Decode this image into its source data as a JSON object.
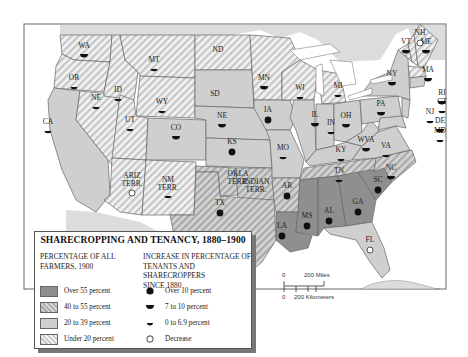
{
  "map": {
    "title": "SHARECROPPING AND TENANCY, 1880–1900",
    "colors": {
      "over55": "#8f8f8f",
      "c40to55_bg": "#d2d2d2",
      "c40to55_stripe": "#a9a9a9",
      "c20to39": "#cfcfcf",
      "under20_bg": "#f2f2f2",
      "under20_stripe": "#c8c8c8",
      "water": "#ffffff",
      "foreign": "#dcdcdc",
      "border": "#666666"
    },
    "states": [
      {
        "abbr": "WA",
        "category": "under20",
        "increase": "7to10"
      },
      {
        "abbr": "OR",
        "category": "under20",
        "increase": "0to6.9"
      },
      {
        "abbr": "CA",
        "category": "20to39",
        "increase": "0to6.9"
      },
      {
        "abbr": "NE",
        "category": "under20",
        "increase": "0to6.9",
        "note": "Nevada (printed NE)"
      },
      {
        "abbr": "ID",
        "category": "under20",
        "increase": "0to6.9"
      },
      {
        "abbr": "MT",
        "category": "under20",
        "increase": "0to6.9"
      },
      {
        "abbr": "WY",
        "category": "under20",
        "increase": "0to6.9"
      },
      {
        "abbr": "UT",
        "category": "under20",
        "increase": "0to6.9"
      },
      {
        "abbr": "CO",
        "category": "20to39",
        "increase": "7to10"
      },
      {
        "abbr": "ARIZ TERR.",
        "category": "under20",
        "increase": "decrease"
      },
      {
        "abbr": "NM TERR.",
        "category": "under20",
        "increase": "0to6.9"
      },
      {
        "abbr": "ND",
        "category": "under20",
        "increase": "none"
      },
      {
        "abbr": "SD",
        "category": "20to39",
        "increase": "none"
      },
      {
        "abbr": "NE",
        "category": "20to39",
        "increase": "7to10",
        "note": "Nebraska"
      },
      {
        "abbr": "KS",
        "category": "20to39",
        "increase": "over10"
      },
      {
        "abbr": "OKLA TERR.",
        "category": "40to55",
        "increase": "none"
      },
      {
        "abbr": "INDIAN TERR.",
        "category": "40to55",
        "increase": "none"
      },
      {
        "abbr": "TX",
        "category": "40to55",
        "increase": "over10"
      },
      {
        "abbr": "MN",
        "category": "under20",
        "increase": "7to10"
      },
      {
        "abbr": "IA",
        "category": "20to39",
        "increase": "over10"
      },
      {
        "abbr": "MO",
        "category": "20to39",
        "increase": "0to6.9"
      },
      {
        "abbr": "AR",
        "category": "40to55",
        "increase": "over10"
      },
      {
        "abbr": "LA",
        "category": "over55",
        "increase": "over10"
      },
      {
        "abbr": "WI",
        "category": "under20",
        "increase": "0to6.9"
      },
      {
        "abbr": "IL",
        "category": "20to39",
        "increase": "7to10"
      },
      {
        "abbr": "MI",
        "category": "under20",
        "increase": "0to6.9"
      },
      {
        "abbr": "IN",
        "category": "20to39",
        "increase": "0to6.9"
      },
      {
        "abbr": "OH",
        "category": "20to39",
        "increase": "7to10"
      },
      {
        "abbr": "KY",
        "category": "20to39",
        "increase": "0to6.9"
      },
      {
        "abbr": "TN",
        "category": "40to55",
        "increase": "0to6.9"
      },
      {
        "abbr": "MS",
        "category": "over55",
        "increase": "over10"
      },
      {
        "abbr": "AL",
        "category": "over55",
        "increase": "over10"
      },
      {
        "abbr": "GA",
        "category": "over55",
        "increase": "over10"
      },
      {
        "abbr": "SC",
        "category": "over55",
        "increase": "over10"
      },
      {
        "abbr": "NC",
        "category": "40to55",
        "increase": "7to10"
      },
      {
        "abbr": "VA",
        "category": "20to39",
        "increase": "0to6.9"
      },
      {
        "abbr": "WVA",
        "category": "20to39",
        "increase": "7to10"
      },
      {
        "abbr": "PA",
        "category": "20to39",
        "increase": "7to10"
      },
      {
        "abbr": "NY",
        "category": "20to39",
        "increase": "7to10"
      },
      {
        "abbr": "VT",
        "category": "under20",
        "increase": "7to10"
      },
      {
        "abbr": "NH",
        "category": "under20",
        "increase": "decrease"
      },
      {
        "abbr": "ME",
        "category": "under20",
        "increase": "7to10"
      },
      {
        "abbr": "MA",
        "category": "under20",
        "increase": "7to10"
      },
      {
        "abbr": "RI",
        "category": "20to39",
        "increase": "7to10"
      },
      {
        "abbr": "CT",
        "category": "20to39",
        "increase": "0to6.9"
      },
      {
        "abbr": "NJ",
        "category": "20to39",
        "increase": "0to6.9"
      },
      {
        "abbr": "DE",
        "category": "40to55",
        "increase": "7to10"
      },
      {
        "abbr": "MD",
        "category": "20to39",
        "increase": "0to6.9"
      },
      {
        "abbr": "FL",
        "category": "20to39",
        "increase": "decrease"
      }
    ]
  },
  "legend": {
    "title": "SHARECROPPING AND TENANCY, 1880–1900",
    "left_heading_1": "PERCENTAGE OF ALL",
    "left_heading_2": "FARMERS, 1900",
    "right_heading_1": "INCREASE IN PERCENTAGE OF",
    "right_heading_2": "TENANTS AND SHARECROPPERS",
    "right_heading_3": "SINCE 1880",
    "categories": [
      {
        "key": "over55",
        "label": "Over 55 percent"
      },
      {
        "key": "40to55",
        "label": "40 to 55 percent"
      },
      {
        "key": "20to39",
        "label": "20 to 39 percent"
      },
      {
        "key": "under20",
        "label": "Under 20 percent"
      }
    ],
    "symbols": [
      {
        "key": "over10",
        "label": "Over 10 percent"
      },
      {
        "key": "7to10",
        "label": "7 to 10  percent"
      },
      {
        "key": "0to6.9",
        "label": "0 to 6.9 percent"
      },
      {
        "key": "decrease",
        "label": "Decrease"
      }
    ]
  },
  "scale": {
    "miles_zero": "0",
    "miles_label": "200 Miles",
    "km_zero": "0",
    "km_label": "200 Kilometers"
  }
}
